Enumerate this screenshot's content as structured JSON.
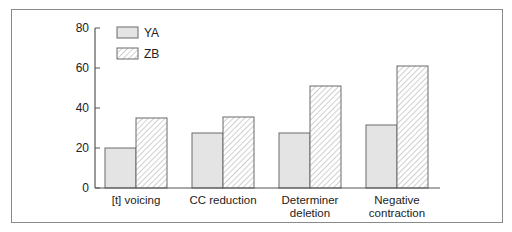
{
  "chart_data": {
    "type": "bar",
    "title": "",
    "xlabel": "",
    "ylabel": "",
    "ylim": [
      0,
      80
    ],
    "yticks": [
      0,
      20,
      40,
      60,
      80
    ],
    "grid": false,
    "legend_position": "upper-left",
    "categories": [
      [
        "[t] voicing"
      ],
      [
        "CC reduction"
      ],
      [
        "Determiner",
        "deletion"
      ],
      [
        "Negative",
        "contraction"
      ]
    ],
    "category_names": [
      "[t] voicing",
      "CC reduction",
      "Determiner deletion",
      "Negative contraction"
    ],
    "series": [
      {
        "name": "YA",
        "fill": "solid-light-gray",
        "color": "#e4e4e4",
        "values": [
          20,
          27.5,
          27.5,
          31.5
        ]
      },
      {
        "name": "ZB",
        "fill": "diagonal-hatch",
        "color": "#ffffff",
        "values": [
          35,
          35.5,
          51,
          61
        ]
      }
    ]
  },
  "colors": {
    "axis": "#555555",
    "bar_outline": "#6a6a6a",
    "ya_fill": "#e4e4e4",
    "hatch": "#9a9a9a",
    "frame": "#8a8a8a"
  }
}
